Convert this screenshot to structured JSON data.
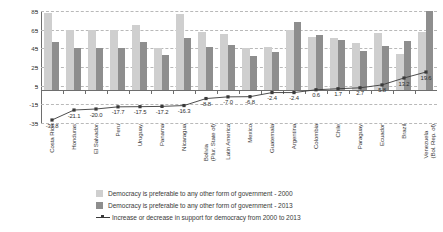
{
  "chart_data": {
    "type": "bar",
    "title": "",
    "xlabel": "",
    "ylabel": "",
    "ylim": [
      -35,
      85
    ],
    "yticks": [
      85,
      65,
      45,
      25,
      5,
      -15,
      -35
    ],
    "grid": true,
    "legend_position": "bottom",
    "categories": [
      "Costa Rica",
      "Honduras",
      "El Salvador",
      "Peru",
      "Uruguay",
      "Panama",
      "Nicaragua",
      "Bolivia\n(Plur. State of)",
      "Latin America",
      "Mexico",
      "Guatemala",
      "Argentina",
      "Colombia",
      "Chile",
      "Paraguay",
      "Ecuador",
      "Brazil",
      "Venezuela\n(Bol. Rep. of)"
    ],
    "series": [
      {
        "name": "Democracy is preferable to any other form of government - 2000",
        "type": "bar",
        "color": "#cfcfcf",
        "values": [
          83,
          65,
          65,
          65,
          70,
          45,
          82,
          63,
          60,
          45,
          46,
          65,
          57,
          56,
          51,
          61,
          39,
          62
        ]
      },
      {
        "name": "Democracy is preferable to any other form of government - 2013",
        "type": "bar",
        "color": "#8e8e8e",
        "values": [
          52,
          45,
          45,
          45,
          52,
          38,
          56,
          46,
          49,
          37,
          41,
          73,
          59,
          54,
          42,
          48,
          53,
          85
        ]
      },
      {
        "name": "Increase or decrease in support for democracy from 2000 to 2013",
        "type": "line",
        "color": "#3a3a3a",
        "values": [
          -31.8,
          -21.1,
          -20.0,
          -17.7,
          -17.5,
          -17.2,
          -16.3,
          -8.8,
          -7.0,
          -6.8,
          -2.4,
          -2.4,
          0.6,
          1.7,
          2.7,
          5.8,
          13.2,
          19.6
        ]
      }
    ]
  },
  "legend": {
    "items": [
      {
        "label": "Democracy is preferable to any other form of government - 2000",
        "swatch": "bar-light-swatch"
      },
      {
        "label": "Democracy is preferable to any other form of government - 2013",
        "swatch": "bar-dark-swatch"
      },
      {
        "label": "Increase or decrease in support for democracy from 2000 to 2013",
        "swatch": "line-marker-swatch"
      }
    ]
  },
  "colors": {
    "bar_2000": "#cfcfcf",
    "bar_2013": "#8e8e8e",
    "line": "#3a3a3a",
    "grid": "#b9b9b9",
    "axis": "#6e6e6e",
    "background": "#ffffff"
  }
}
